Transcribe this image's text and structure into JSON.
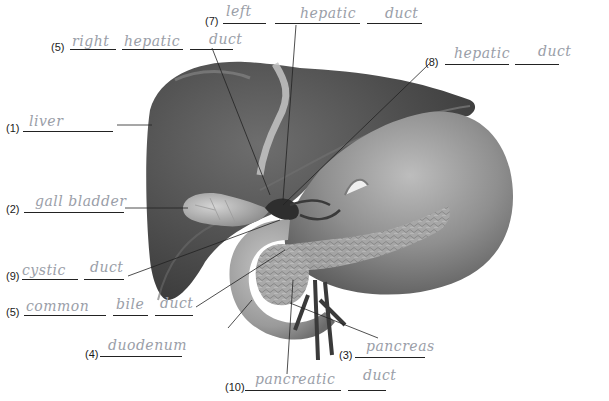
{
  "worksheet": {
    "subject": "Liver, gallbladder, duodenum and pancreas — labeled diagram",
    "ink_color": "#9a9ea8",
    "print_color": "#1a1a1a"
  },
  "labels": [
    {
      "num": "(1)",
      "answer": "liver",
      "blanks": 1
    },
    {
      "num": "(2)",
      "answer": "gall bladder",
      "blanks": 1
    },
    {
      "num": "(3)",
      "answer": "pancreas",
      "blanks": 1
    },
    {
      "num": "(4)",
      "answer": "duodenum",
      "blanks": 1
    },
    {
      "num": "(5)",
      "answer_words": [
        "common",
        "bile",
        "duct"
      ],
      "blanks": 3
    },
    {
      "num": "(6)",
      "answer_words": [
        "right",
        "hepatic",
        "duct"
      ],
      "blanks": 3
    },
    {
      "num": "(7)",
      "answer_words": [
        "left",
        "hepatic",
        "duct"
      ],
      "blanks": 3
    },
    {
      "num": "(8)",
      "answer_words": [
        "hepatic",
        "duct"
      ],
      "blanks": 2
    },
    {
      "num": "(9)",
      "answer_words": [
        "cystic",
        "duct"
      ],
      "blanks": 2
    },
    {
      "num": "(10)",
      "answer_words": [
        "pancreatic",
        "duct"
      ],
      "blanks": 2
    }
  ]
}
